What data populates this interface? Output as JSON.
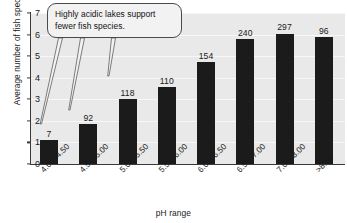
{
  "chart_data": {
    "type": "bar",
    "title": "",
    "xlabel": "pH range",
    "ylabel": "Average number of fish species",
    "categories": [
      "4.00–4.50",
      "4.51–5.00",
      "5.01–5.50",
      "5.51–6.00",
      "6.01–6.50",
      "6.51–7.00",
      "7.01–8.00",
      ">8.00"
    ],
    "values": [
      1.1,
      1.85,
      3.0,
      3.55,
      4.75,
      5.8,
      6.05,
      5.9
    ],
    "point_labels": [
      "7",
      "92",
      "118",
      "110",
      "154",
      "240",
      "297",
      "96"
    ],
    "ylim": [
      0,
      7
    ],
    "yticks": [
      "0",
      "1",
      "2",
      "3",
      "4",
      "5",
      "6",
      "7"
    ],
    "grid": true,
    "legend": "none",
    "bar_color": "#1b1b1b",
    "plot_background": "#e9e9e9",
    "annotations": [
      {
        "name": "acidic-lakes-callout",
        "lines": [
          "Highly acidic lakes support",
          "fewer fish species."
        ],
        "points_to": [
          "4.00–4.50",
          "4.51–5.00",
          "5.01–5.50"
        ]
      }
    ]
  }
}
